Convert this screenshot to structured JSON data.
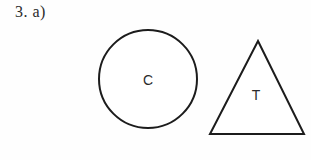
{
  "page": {
    "background_color": "#fefefe",
    "width": 311,
    "height": 160
  },
  "problem": {
    "label": "3. a)"
  },
  "figures": {
    "stroke_color": "#1c1c1c",
    "fill_color": "#ffffff",
    "text_color": "#2b2b2b",
    "circle": {
      "name": "circle",
      "letter": "C",
      "center_x": 148,
      "center_y": 79,
      "radius": 49,
      "stroke_width": 2
    },
    "triangle": {
      "name": "triangle",
      "letter": "T",
      "apex_x": 258,
      "apex_y": 41,
      "base_left_x": 210,
      "base_right_x": 304,
      "base_y": 134,
      "stroke_width": 2,
      "label_x": 256,
      "label_y": 95
    }
  }
}
